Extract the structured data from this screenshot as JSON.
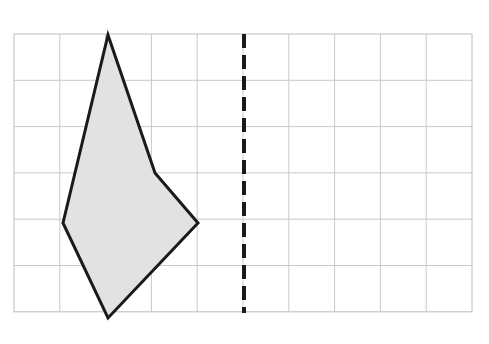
{
  "figure": {
    "title": "Shaded polygon on a grid with a vertical dashed line of symmetry",
    "canvas": {
      "width": 489,
      "height": 344,
      "background": "#ffffff"
    },
    "grid": {
      "name": "square-grid",
      "origin_x": 14,
      "origin_y": 34,
      "cell_width": 45.8,
      "cell_height": 46.3,
      "columns": 10,
      "rows": 6,
      "line_color": "#c9c9c9",
      "border_color": "#bdbdbd",
      "line_width": 1
    },
    "polygon": {
      "name": "shaded-kite-polygon",
      "label": "shaded polygon",
      "fill_color": "#e2e2e2",
      "stroke_color": "#1a1a1a",
      "stroke_width": 3,
      "vertices": [
        {
          "name": "top-apex",
          "x": 108,
          "y": 35,
          "grid_col": 2,
          "grid_row": 0
        },
        {
          "name": "right-concave-notch",
          "x": 155,
          "y": 173,
          "grid_col": 3,
          "grid_row": 3
        },
        {
          "name": "right-point",
          "x": 198,
          "y": 223,
          "grid_col": 4,
          "grid_row": 4
        },
        {
          "name": "bottom-apex",
          "x": 108,
          "y": 318,
          "grid_col": 2,
          "grid_row": 6
        },
        {
          "name": "left-point",
          "x": 63,
          "y": 223,
          "grid_col": 1,
          "grid_row": 4
        }
      ],
      "points_attr": "108,35 155,173 198,223 108,318 63,223"
    },
    "dashed_line": {
      "name": "line-of-symmetry",
      "label": "dashed vertical line",
      "orientation": "vertical",
      "x": 244,
      "y_start": 34,
      "y_end": 313,
      "color": "#1a1a1a",
      "width": 4,
      "dash_length": 14,
      "gap_length": 7,
      "dash_array": "14 7"
    }
  }
}
